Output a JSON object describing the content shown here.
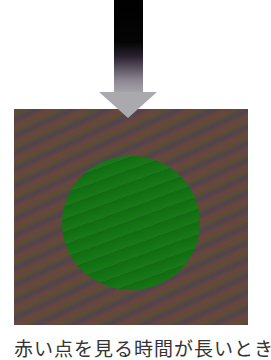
{
  "figure": {
    "arrow": {
      "direction": "down",
      "icon": "down-arrow-icon",
      "gradient_from": "#000000",
      "gradient_to": "#a9a9ae"
    },
    "square": {
      "color": "#5e4a42",
      "pattern": "diagonal-moire"
    },
    "circle": {
      "color": "#137413"
    },
    "caption": "赤い点を見る時間が長いとき"
  }
}
